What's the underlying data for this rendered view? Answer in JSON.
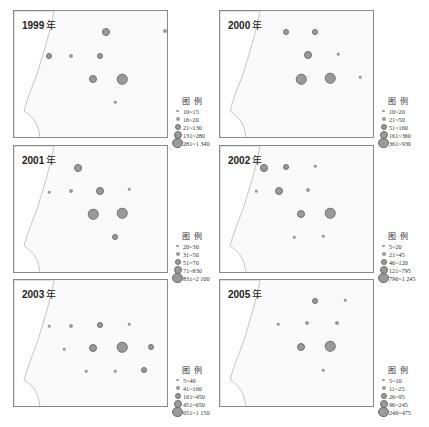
{
  "figure": {
    "legend_title": "图 例",
    "caption": "",
    "panel_year_suffix": "年"
  },
  "panels": [
    {
      "year": "1999",
      "legend": [
        "10~15",
        "16~20",
        "21~130",
        "131~280",
        "281~1 340"
      ]
    },
    {
      "year": "2000",
      "legend": [
        "10~20",
        "21~50",
        "51~160",
        "161~360",
        "361~930"
      ]
    },
    {
      "year": "2001",
      "legend": [
        "20~30",
        "31~50",
        "51~70",
        "71~830",
        "831~2 100"
      ]
    },
    {
      "year": "2002",
      "legend": [
        "5~20",
        "21~45",
        "46~120",
        "121~795",
        "796~1 245"
      ]
    },
    {
      "year": "2003",
      "legend": [
        "5~40",
        "41~160",
        "161~450",
        "451~650",
        "651~1 150"
      ]
    },
    {
      "year": "2005",
      "legend": [
        "5~10",
        "11~25",
        "26~95",
        "96~245",
        "246~475"
      ]
    }
  ],
  "chart_data": [
    {
      "type": "scatter",
      "title": "1999 年",
      "legend_title": "图 例",
      "size_classes": [
        "10~15",
        "16~20",
        "21~130",
        "131~280",
        "281~1 340"
      ],
      "points": [
        {
          "x": 48,
          "y": 55,
          "class": 3
        },
        {
          "x": 70,
          "y": 55,
          "class": 2
        },
        {
          "x": 105,
          "y": 31,
          "class": 4
        },
        {
          "x": 164,
          "y": 30,
          "class": 2
        },
        {
          "x": 99,
          "y": 55,
          "class": 3
        },
        {
          "x": 92,
          "y": 78,
          "class": 4
        },
        {
          "x": 121,
          "y": 78,
          "class": 5
        },
        {
          "x": 114,
          "y": 101,
          "class": 1
        }
      ]
    },
    {
      "type": "scatter",
      "title": "2000 年",
      "legend_title": "图 例",
      "size_classes": [
        "10~20",
        "21~50",
        "51~160",
        "161~360",
        "361~930"
      ],
      "points": [
        {
          "x": 285,
          "y": 31,
          "class": 3
        },
        {
          "x": 314,
          "y": 31,
          "class": 3
        },
        {
          "x": 374,
          "y": 29,
          "class": 1
        },
        {
          "x": 307,
          "y": 54,
          "class": 4
        },
        {
          "x": 337,
          "y": 53,
          "class": 1
        },
        {
          "x": 300,
          "y": 78,
          "class": 5
        },
        {
          "x": 329,
          "y": 77,
          "class": 5
        },
        {
          "x": 359,
          "y": 76,
          "class": 1
        }
      ]
    },
    {
      "type": "scatter",
      "title": "2001 年",
      "legend_title": "图 例",
      "size_classes": [
        "20~30",
        "31~50",
        "51~70",
        "71~830",
        "831~2 100"
      ],
      "points": [
        {
          "x": 77,
          "y": 167,
          "class": 4
        },
        {
          "x": 48,
          "y": 191,
          "class": 1
        },
        {
          "x": 70,
          "y": 190,
          "class": 2
        },
        {
          "x": 99,
          "y": 190,
          "class": 4
        },
        {
          "x": 128,
          "y": 188,
          "class": 1
        },
        {
          "x": 92,
          "y": 213,
          "class": 5
        },
        {
          "x": 121,
          "y": 212,
          "class": 5
        },
        {
          "x": 114,
          "y": 236,
          "class": 3
        }
      ]
    },
    {
      "type": "scatter",
      "title": "2002 年",
      "legend_title": "图 例",
      "size_classes": [
        "5~20",
        "21~45",
        "46~120",
        "121~795",
        "796~1 245"
      ],
      "points": [
        {
          "x": 263,
          "y": 167,
          "class": 4
        },
        {
          "x": 285,
          "y": 166,
          "class": 3
        },
        {
          "x": 314,
          "y": 165,
          "class": 1
        },
        {
          "x": 255,
          "y": 190,
          "class": 1
        },
        {
          "x": 278,
          "y": 190,
          "class": 4
        },
        {
          "x": 307,
          "y": 189,
          "class": 2
        },
        {
          "x": 300,
          "y": 213,
          "class": 4
        },
        {
          "x": 329,
          "y": 212,
          "class": 5
        },
        {
          "x": 293,
          "y": 236,
          "class": 1
        },
        {
          "x": 322,
          "y": 235,
          "class": 1
        }
      ]
    },
    {
      "type": "scatter",
      "title": "2003 年",
      "legend_title": "图 例",
      "size_classes": [
        "5~40",
        "41~160",
        "161~450",
        "451~650",
        "651~1 150"
      ],
      "points": [
        {
          "x": 48,
          "y": 325,
          "class": 1
        },
        {
          "x": 70,
          "y": 325,
          "class": 2
        },
        {
          "x": 99,
          "y": 324,
          "class": 3
        },
        {
          "x": 128,
          "y": 323,
          "class": 1
        },
        {
          "x": 63,
          "y": 348,
          "class": 1
        },
        {
          "x": 92,
          "y": 347,
          "class": 4
        },
        {
          "x": 121,
          "y": 346,
          "class": 5
        },
        {
          "x": 150,
          "y": 346,
          "class": 3
        },
        {
          "x": 85,
          "y": 370,
          "class": 1
        },
        {
          "x": 114,
          "y": 370,
          "class": 1
        },
        {
          "x": 143,
          "y": 369,
          "class": 3
        }
      ]
    },
    {
      "type": "scatter",
      "title": "2005 年",
      "legend_title": "图 例",
      "size_classes": [
        "5~10",
        "11~25",
        "26~95",
        "96~245",
        "246~475"
      ],
      "points": [
        {
          "x": 314,
          "y": 300,
          "class": 3
        },
        {
          "x": 344,
          "y": 299,
          "class": 1
        },
        {
          "x": 277,
          "y": 323,
          "class": 1
        },
        {
          "x": 306,
          "y": 322,
          "class": 2
        },
        {
          "x": 336,
          "y": 322,
          "class": 2
        },
        {
          "x": 300,
          "y": 346,
          "class": 4
        },
        {
          "x": 329,
          "y": 345,
          "class": 5
        },
        {
          "x": 322,
          "y": 369,
          "class": 1
        }
      ]
    }
  ]
}
